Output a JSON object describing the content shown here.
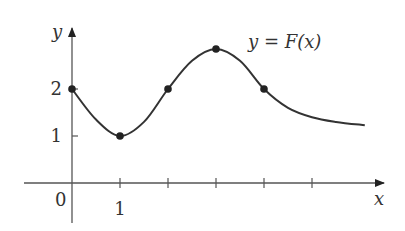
{
  "chart_data": {
    "type": "line",
    "title": "",
    "curve_label": "y = F(x)",
    "xlabel": "x",
    "ylabel": "y",
    "origin_label": "0",
    "x_tick_positions": [
      1,
      2,
      3,
      4,
      5
    ],
    "x_tick_labels": [
      {
        "x": 1,
        "label": "1"
      }
    ],
    "y_tick_positions": [
      1,
      2
    ],
    "y_tick_labels": [
      {
        "y": 1,
        "label": "1"
      },
      {
        "y": 2,
        "label": "2"
      }
    ],
    "xlim": [
      -1,
      6.5
    ],
    "ylim": [
      -0.85,
      3.3
    ],
    "grid": false,
    "series": [
      {
        "name": "F(x)",
        "curve": [
          {
            "x": 0,
            "y": 2
          },
          {
            "x": 0.5,
            "y": 1.35
          },
          {
            "x": 1,
            "y": 1
          },
          {
            "x": 1.5,
            "y": 1.3
          },
          {
            "x": 2,
            "y": 2
          },
          {
            "x": 2.5,
            "y": 2.6
          },
          {
            "x": 3,
            "y": 2.85
          },
          {
            "x": 3.5,
            "y": 2.6
          },
          {
            "x": 4,
            "y": 2
          },
          {
            "x": 4.5,
            "y": 1.6
          },
          {
            "x": 5,
            "y": 1.4
          },
          {
            "x": 5.5,
            "y": 1.3
          },
          {
            "x": 6.1,
            "y": 1.23
          }
        ],
        "marked_points": [
          {
            "x": 0,
            "y": 2
          },
          {
            "x": 1,
            "y": 1
          },
          {
            "x": 2,
            "y": 2
          },
          {
            "x": 3,
            "y": 2.85
          },
          {
            "x": 4,
            "y": 2
          }
        ]
      }
    ],
    "colors": {
      "curve": "#333333",
      "axes": "#555555",
      "points": "#222222"
    }
  }
}
